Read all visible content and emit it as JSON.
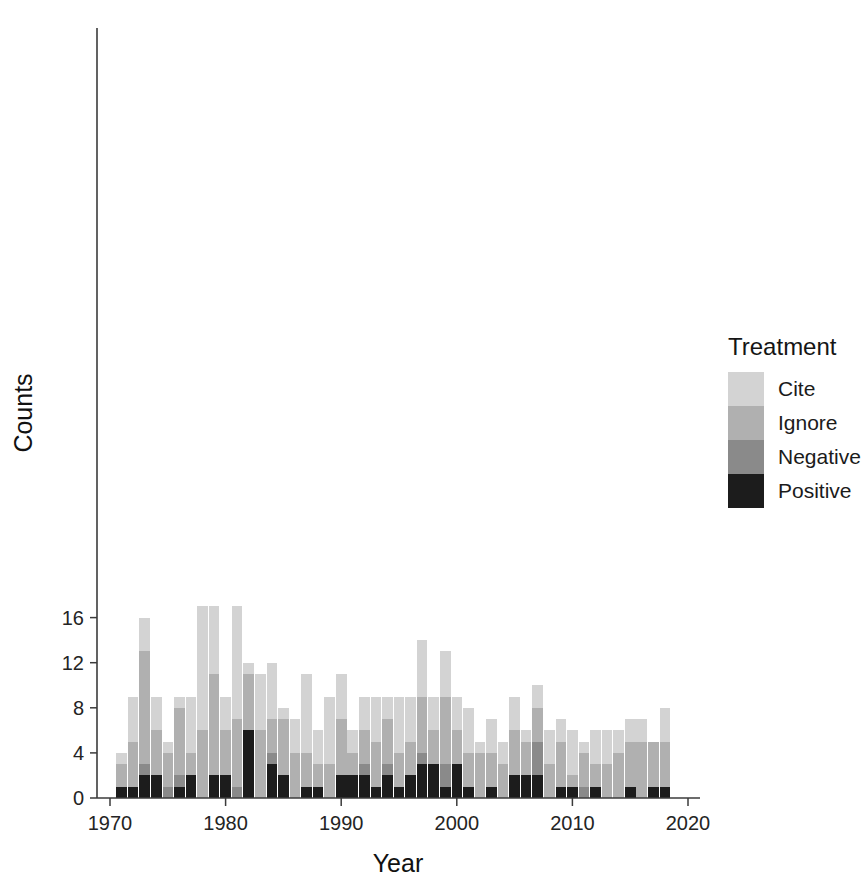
{
  "chart_data": {
    "type": "bar",
    "subtype": "stacked",
    "title": "",
    "xlabel": "Year",
    "ylabel": "Counts",
    "xlim": [
      1969,
      2020
    ],
    "ylim": [
      0,
      17.6
    ],
    "xticks": [
      1970,
      1980,
      1990,
      2000,
      2010,
      2020
    ],
    "yticks": [
      0,
      4,
      8,
      12,
      16
    ],
    "grid": false,
    "legend": {
      "title": "Treatment",
      "position": "right",
      "entries": [
        {
          "name": "Cite",
          "color": "#d3d3d3"
        },
        {
          "name": "Ignore",
          "color": "#b0b0b0"
        },
        {
          "name": "Negative",
          "color": "#8a8a8a"
        },
        {
          "name": "Positive",
          "color": "#1c1c1c"
        }
      ]
    },
    "stack_order_bottom_to_top": [
      "Positive",
      "Negative",
      "Ignore",
      "Cite"
    ],
    "categories": [
      1970,
      1971,
      1972,
      1973,
      1974,
      1975,
      1976,
      1977,
      1978,
      1979,
      1980,
      1981,
      1982,
      1983,
      1984,
      1985,
      1986,
      1987,
      1988,
      1989,
      1990,
      1991,
      1992,
      1993,
      1994,
      1995,
      1996,
      1997,
      1998,
      1999,
      2000,
      2001,
      2002,
      2003,
      2004,
      2005,
      2006,
      2007,
      2008,
      2009,
      2010,
      2011,
      2012,
      2013,
      2014,
      2015,
      2016,
      2017,
      2018
    ],
    "series": [
      {
        "name": "Positive",
        "color": "#1c1c1c",
        "values": [
          0,
          1,
          1,
          2,
          2,
          0,
          1,
          2,
          0,
          2,
          2,
          0,
          6,
          0,
          3,
          2,
          0,
          1,
          1,
          0,
          2,
          2,
          2,
          1,
          2,
          1,
          2,
          3,
          3,
          1,
          3,
          1,
          0,
          1,
          0,
          2,
          2,
          2,
          0,
          1,
          1,
          0,
          1,
          0,
          0,
          1,
          0,
          1,
          1
        ]
      },
      {
        "name": "Negative",
        "color": "#8a8a8a",
        "values": [
          0,
          0,
          0,
          1,
          0,
          1,
          1,
          0,
          0,
          0,
          0,
          1,
          0,
          0,
          1,
          0,
          0,
          0,
          0,
          0,
          0,
          0,
          1,
          0,
          1,
          0,
          0,
          1,
          0,
          2,
          0,
          0,
          0,
          0,
          0,
          0,
          0,
          3,
          0,
          0,
          0,
          1,
          0,
          0,
          0,
          0,
          0,
          0,
          0
        ]
      },
      {
        "name": "Ignore",
        "color": "#b0b0b0",
        "values": [
          0,
          2,
          4,
          10,
          4,
          3,
          6,
          2,
          6,
          9,
          4,
          6,
          5,
          6,
          3,
          5,
          4,
          3,
          2,
          3,
          5,
          2,
          3,
          4,
          4,
          3,
          3,
          5,
          3,
          6,
          3,
          3,
          4,
          3,
          3,
          4,
          3,
          3,
          3,
          4,
          1,
          3,
          2,
          3,
          4,
          4,
          5,
          4,
          4
        ]
      },
      {
        "name": "Cite",
        "color": "#d3d3d3",
        "values": [
          0,
          1,
          4,
          3,
          3,
          1,
          1,
          5,
          11,
          6,
          3,
          10,
          1,
          5,
          5,
          1,
          3,
          7,
          3,
          6,
          4,
          2,
          3,
          4,
          2,
          5,
          4,
          5,
          3,
          4,
          3,
          4,
          1,
          3,
          2,
          3,
          1,
          2,
          3,
          2,
          4,
          1,
          3,
          3,
          2,
          2,
          2,
          0,
          3
        ]
      }
    ],
    "totals": [
      0,
      4,
      9,
      16,
      9,
      5,
      9,
      9,
      17,
      17,
      9,
      17,
      12,
      11,
      12,
      8,
      7,
      11,
      6,
      9,
      11,
      6,
      9,
      9,
      9,
      9,
      9,
      14,
      9,
      13,
      9,
      8,
      5,
      7,
      5,
      9,
      6,
      10,
      6,
      7,
      6,
      5,
      6,
      6,
      6,
      7,
      7,
      5,
      8
    ]
  }
}
